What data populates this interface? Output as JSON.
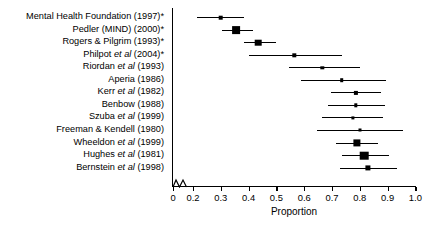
{
  "figure": {
    "type": "forest-plot",
    "background": "#ffffff",
    "foreground": "#000000"
  },
  "axis": {
    "xlabel": "Proportion",
    "tick_labels": [
      "0",
      "0.2",
      "0.3",
      "0.4",
      "0.5",
      "0.6",
      "0.7",
      "0.8",
      "0.9",
      "1.0"
    ],
    "tick_values": [
      0,
      0.2,
      0.3,
      0.4,
      0.5,
      0.6,
      0.7,
      0.8,
      0.9,
      1.0
    ],
    "range": [
      0.2,
      1.0
    ],
    "broken_axis": true,
    "break_note": "zigzag break between 0 and 0.2"
  },
  "chart_data": {
    "type": "scatter",
    "title": "",
    "xlabel": "Proportion",
    "ylabel": "",
    "xlim": [
      0.2,
      1.0
    ],
    "grid": false,
    "legend": "none",
    "orientation": "horizontal",
    "categories": [
      "Mental Health Foundation (1997)*",
      "Pedler (MIND) (2000)*",
      "Rogers & Pilgrim (1993)*",
      "Philpot et al (2004)*",
      "Riordan et al (1993)",
      "Aperia (1986)",
      "Kerr et al (1982)",
      "Benbow (1988)",
      "Szuba et al (1999)",
      "Freeman & Kendell (1980)",
      "Wheeldon et al (1999)",
      "Hughes et al (1981)",
      "Bernstein et al (1998)"
    ],
    "points": [
      {
        "label": "Mental Health Foundation (1997)*",
        "value": 0.3,
        "ci_low": 0.215,
        "ci_high": 0.385,
        "marker_size": 4.6
      },
      {
        "label": "Pedler (MIND) (2000)*",
        "value": 0.355,
        "ci_low": 0.305,
        "ci_high": 0.415,
        "marker_size": 7.8
      },
      {
        "label": "Rogers & Pilgrim (1993)*",
        "value": 0.435,
        "ci_low": 0.385,
        "ci_high": 0.5,
        "marker_size": 6.6
      },
      {
        "label": "Philpot et al (2004)*",
        "value": 0.565,
        "ci_low": 0.4,
        "ci_high": 0.735,
        "marker_size": 3.4
      },
      {
        "label": "Riordan et al (1993)",
        "value": 0.665,
        "ci_low": 0.545,
        "ci_high": 0.8,
        "marker_size": 3.4
      },
      {
        "label": "Aperia (1986)",
        "value": 0.735,
        "ci_low": 0.59,
        "ci_high": 0.895,
        "marker_size": 3.6
      },
      {
        "label": "Kerr et al (1982)",
        "value": 0.785,
        "ci_low": 0.695,
        "ci_high": 0.875,
        "marker_size": 4.2
      },
      {
        "label": "Benbow (1988)",
        "value": 0.785,
        "ci_low": 0.685,
        "ci_high": 0.89,
        "marker_size": 3.4
      },
      {
        "label": "Szuba et al (1999)",
        "value": 0.775,
        "ci_low": 0.665,
        "ci_high": 0.885,
        "marker_size": 3.2
      },
      {
        "label": "Freeman & Kendell (1980)",
        "value": 0.8,
        "ci_low": 0.645,
        "ci_high": 0.955,
        "marker_size": 3.0
      },
      {
        "label": "Wheeldon et al (1999)",
        "value": 0.79,
        "ci_low": 0.715,
        "ci_high": 0.865,
        "marker_size": 7.2
      },
      {
        "label": "Hughes et al (1981)",
        "value": 0.815,
        "ci_low": 0.735,
        "ci_high": 0.905,
        "marker_size": 8.6
      },
      {
        "label": "Bernstein et al (1998)",
        "value": 0.83,
        "ci_low": 0.73,
        "ci_high": 0.935,
        "marker_size": 5.2
      }
    ]
  }
}
